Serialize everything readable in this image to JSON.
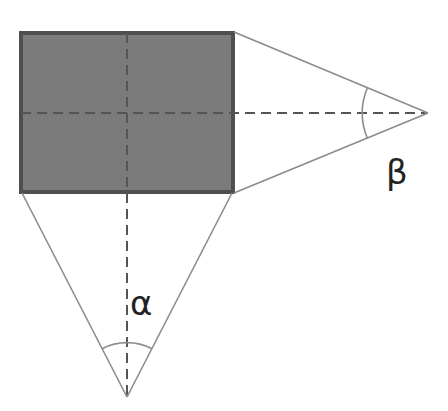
{
  "diagram": {
    "type": "geometry",
    "colors": {
      "rect_fill": "#7b7b7b",
      "rect_border": "#4f4f4f",
      "triangle_lines": "#8c8c8c",
      "dashed_lines": "#555555",
      "arc": "#8c8c8c",
      "text": "#222222"
    },
    "rectangle": {
      "x": 20,
      "y": 32,
      "width": 214,
      "height": 161
    },
    "right_apex": {
      "x": 428,
      "y": 113
    },
    "bottom_apex": {
      "x": 127,
      "y": 397
    },
    "labels": {
      "alpha": "α",
      "beta": "β"
    }
  }
}
